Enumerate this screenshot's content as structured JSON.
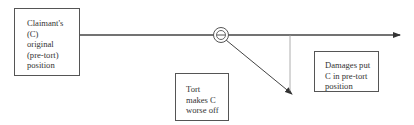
{
  "diagram": {
    "boxes": {
      "original_position": {
        "label": "Claimant's\n(C)\noriginal\n(pre-tort)\nposition"
      },
      "tort": {
        "label": "Tort\nmakes C\nworse off"
      },
      "damages": {
        "label": "Damages put\nC in pre-tort\nposition"
      }
    },
    "symbols": {
      "tort_event": {
        "glyph": "⊖",
        "icon": "minus-circle-icon"
      }
    },
    "colors": {
      "line": "#444444",
      "thin_line": "#999999",
      "text": "#333333"
    }
  }
}
